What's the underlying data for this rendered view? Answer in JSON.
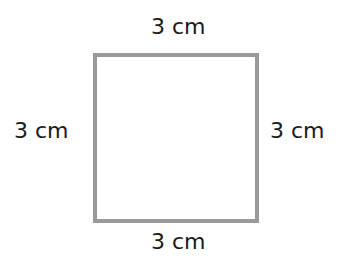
{
  "diagram": {
    "shape": "square",
    "stroke_color": "#9a9a9a",
    "fill_color": "#ffffff",
    "labels": {
      "top": "3 cm",
      "bottom": "3 cm",
      "left": "3 cm",
      "right": "3 cm"
    }
  }
}
